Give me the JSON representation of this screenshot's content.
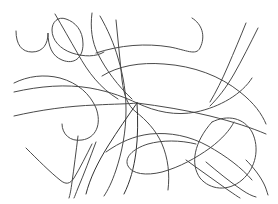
{
  "artwork": {
    "title": "Abstract Freeform Line Drawing",
    "description": "Hand-drawn style abstract composition of thin intersecting curvilinear strokes on a plain white field",
    "medium": "line-art",
    "canvas": {
      "width": 278,
      "height": 204,
      "background_color": "#ffffff"
    },
    "stroke": {
      "color": "#4a4a4a",
      "color_dark": "#333333",
      "width": 1.0,
      "linecap": "round",
      "opacity": 1
    },
    "focal_node": {
      "label": "central convergence node",
      "x": 137,
      "y": 103
    },
    "stroke_count": 16,
    "strokes": [
      {
        "name": "upper-left-hook",
        "color": "#4a4a4a",
        "width": 1.0,
        "d": "M16,31 C16,45 22,52 32,52 C43,52 48,44 48,33 C48,46 52,56 62,60 C74,65 83,58 83,44 C83,30 75,22 66,19 C58,16 52,22 52,30 C52,40 60,49 72,53 C84,57 96,57 104,52"
      },
      {
        "name": "upper-left-descender",
        "color": "#4a4a4a",
        "width": 1.0,
        "d": "M55,14 C62,26 70,40 78,54 C88,72 100,88 118,99"
      },
      {
        "name": "left-sweep-arc",
        "color": "#4a4a4a",
        "width": 1.0,
        "d": "M14,83 C28,76 44,74 60,78 C78,83 90,94 96,108 C102,124 96,138 82,140 C70,142 62,134 62,124"
      },
      {
        "name": "upper-center-fork-left",
        "color": "#4a4a4a",
        "width": 1.0,
        "d": "M92,13 C90,28 92,42 98,54 C106,70 118,86 132,99"
      },
      {
        "name": "upper-center-fork-right",
        "color": "#4a4a4a",
        "width": 1.0,
        "d": "M100,16 C108,30 114,44 118,58 C124,78 126,94 126,110 C126,132 122,152 116,170 C112,182 108,190 104,196"
      },
      {
        "name": "center-vertical-long",
        "color": "#4a4a4a",
        "width": 1.0,
        "d": "M116,20 C118,40 120,60 122,80 C124,96 128,106 136,112 C146,120 156,130 162,144 C168,158 170,174 168,190"
      },
      {
        "name": "upper-horizontal-wave",
        "color": "#4a4a4a",
        "width": 1.0,
        "d": "M96,53 C120,45 146,43 170,47 C186,50 196,56 200,48 C206,36 202,24 192,18"
      },
      {
        "name": "mid-horizontal-sweep",
        "color": "#4a4a4a",
        "width": 1.0,
        "d": "M14,92 C40,86 66,84 90,88 C112,92 126,98 137,103 C156,112 176,116 196,112 C220,107 242,94 252,78"
      },
      {
        "name": "long-shallow-diagonal",
        "color": "#4a4a4a",
        "width": 1.0,
        "d": "M102,76 C118,66 140,62 164,64 C194,66 220,76 240,92 C254,103 262,114 266,124"
      },
      {
        "name": "upper-right-diagonal-a",
        "color": "#4a4a4a",
        "width": 1.0,
        "d": "M246,23 C240,38 234,52 228,66 C222,80 216,92 210,102"
      },
      {
        "name": "upper-right-diagonal-b",
        "color": "#4a4a4a",
        "width": 1.0,
        "d": "M258,28 C250,44 242,60 234,74 C226,88 218,98 210,106"
      },
      {
        "name": "right-lower-horizontal",
        "color": "#4a4a4a",
        "width": 1.0,
        "d": "M137,103 C160,106 186,110 210,116 C234,122 252,128 266,134"
      },
      {
        "name": "left-low-horizontal",
        "color": "#4a4a4a",
        "width": 1.0,
        "d": "M14,116 C40,110 68,106 96,105 C114,104 128,104 137,103"
      },
      {
        "name": "node-radial-down-left",
        "color": "#333333",
        "width": 1.0,
        "d": "M137,103 C128,116 118,130 108,146 C98,162 90,178 86,194"
      },
      {
        "name": "node-radial-down-center",
        "color": "#333333",
        "width": 1.0,
        "d": "M137,103 C138,120 138,136 136,152 C134,168 130,182 124,194"
      },
      {
        "name": "bottom-left-vee",
        "color": "#4a4a4a",
        "width": 1.0,
        "d": "M26,148 C38,160 50,172 60,180 C66,185 70,184 74,178 C80,168 86,156 92,144"
      },
      {
        "name": "bottom-left-slash-a",
        "color": "#4a4a4a",
        "width": 1.0,
        "d": "M78,136 C76,152 74,168 72,182 C71,190 70,195 69,198"
      },
      {
        "name": "bottom-left-slash-b",
        "color": "#4a4a4a",
        "width": 1.0,
        "d": "M96,142 C90,158 84,174 78,188 C76,193 75,196 74,198"
      },
      {
        "name": "bottom-center-loop",
        "color": "#4a4a4a",
        "width": 1.0,
        "d": "M196,144 C180,140 162,140 148,144 C132,149 124,158 128,166 C132,174 146,176 162,172 C180,167 196,158 210,148 C222,139 230,130 234,122"
      },
      {
        "name": "bottom-long-wave",
        "color": "#4a4a4a",
        "width": 1.0,
        "d": "M106,152 C120,142 134,136 150,134 C170,132 190,136 208,146 C226,156 242,168 252,180"
      },
      {
        "name": "lower-right-circle-arc",
        "color": "#4a4a4a",
        "width": 1.0,
        "d": "M212,122 C228,114 244,118 252,132 C260,148 256,168 242,180 C228,192 210,190 200,178 C190,164 194,142 212,122"
      },
      {
        "name": "lower-right-cross-a",
        "color": "#4a4a4a",
        "width": 1.0,
        "d": "M186,160 C200,170 214,180 228,190 C234,194 238,197 240,198"
      },
      {
        "name": "lower-right-cross-b",
        "color": "#4a4a4a",
        "width": 1.0,
        "d": "M206,162 C218,172 230,182 242,190 C248,194 252,196 256,197"
      },
      {
        "name": "right-edge-tail",
        "color": "#4a4a4a",
        "width": 1.0,
        "d": "M246,160 C254,168 260,176 264,184 C266,188 267,192 268,195"
      }
    ]
  }
}
